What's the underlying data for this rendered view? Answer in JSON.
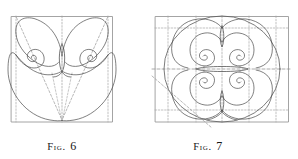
{
  "plate": {
    "type": "figure-plate",
    "background": "#ffffff",
    "stroke_color": "#4a4a4a",
    "frame_color": "#8a8a8a",
    "dash_color": "#9a9a9a",
    "caption_color": "#161616",
    "width": 298,
    "height": 159
  },
  "figures": [
    {
      "id": "fig6",
      "caption_prefix": "Fig.",
      "caption_number": "6",
      "frame": {
        "shape": "square",
        "x": 11,
        "y": 16,
        "w": 102,
        "h": 106
      },
      "description": "Butterfly-and-spiral construction inscribed in a square with dashed construction lines converging at the bottom centre.",
      "elements": [
        "outer-square-frame",
        "dashed-vertical-axis",
        "dashed-left-edge",
        "dashed-right-edge",
        "dashed-diagonal-left",
        "dashed-diagonal-right",
        "dashed-inner-chevron",
        "upper-left-wing",
        "upper-right-wing",
        "lower-heart-lobe",
        "left-logarithmic-spiral",
        "right-logarithmic-spiral",
        "central-vertical-lens"
      ]
    },
    {
      "id": "fig7",
      "caption_prefix": "Fig.",
      "caption_number": "7",
      "frame": {
        "shape": "rectangle",
        "x": 155,
        "y": 16,
        "w": 134,
        "h": 106
      },
      "description": "Vertically symmetric double-spiral figure inside a dashed rectangular grid with a large inscribed circle and an oblique construction line.",
      "elements": [
        "outer-rectangle-frame",
        "dashed-grid-vertical-1",
        "dashed-grid-vertical-2",
        "dashed-grid-vertical-3",
        "dashed-grid-vertical-4",
        "dashed-grid-horizontal-1",
        "dashed-grid-horizontal-mid",
        "dashed-grid-horizontal-3",
        "large-inscribed-circle",
        "upper-double-spiral",
        "lower-double-spiral",
        "central-horizontal-lens",
        "upper-vertical-lens",
        "lower-vertical-lens",
        "oblique-construction-line"
      ]
    }
  ]
}
